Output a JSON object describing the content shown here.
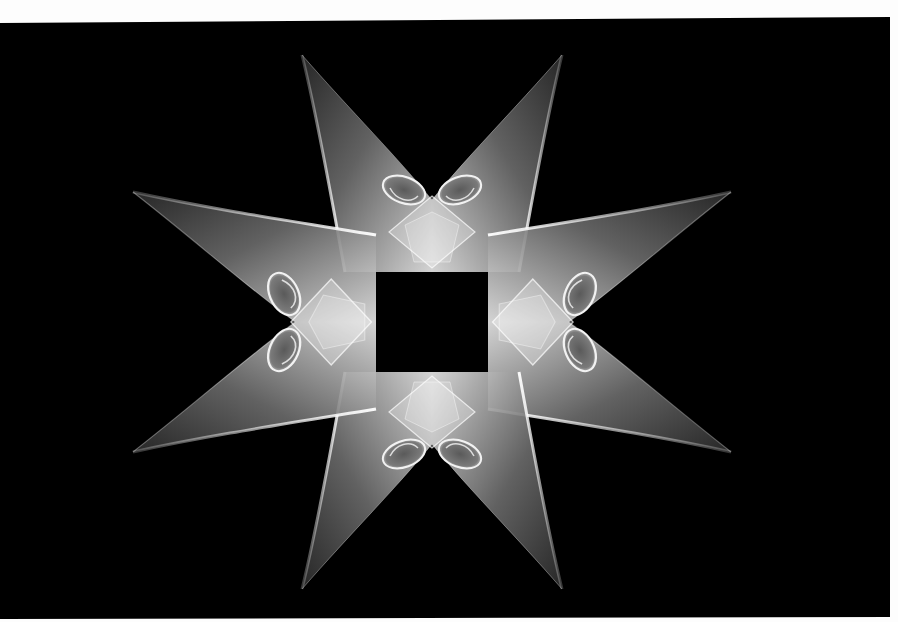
{
  "image": {
    "subject": "eight-pointed fractal star",
    "description": "White and gray flame-like eight-pointed star with scroll curls on a black background, surrounded by a thin white border",
    "colors": {
      "background": "#000000",
      "border": "#fdfdfd",
      "highlight": "#f4f4f4",
      "mid_gray": "#9a9a9a",
      "dark_gray": "#3a3a3a"
    },
    "star": {
      "points": 8,
      "center": [
        432,
        322
      ],
      "tips": [
        [
          302,
          55
        ],
        [
          560,
          55
        ],
        [
          775,
          218
        ],
        [
          775,
          420
        ],
        [
          563,
          586
        ],
        [
          303,
          588
        ],
        [
          92,
          422
        ],
        [
          92,
          222
        ]
      ]
    }
  }
}
